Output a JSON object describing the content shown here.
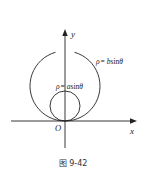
{
  "figure": {
    "caption": "图 9-42",
    "axes": {
      "x_label": "x",
      "y_label": "y",
      "origin_label": "O"
    },
    "curves": [
      {
        "name": "large-circle",
        "equation": "ρ = bsinθ",
        "label_rho": "ρ",
        "label_eq": "= ",
        "label_coef": "b",
        "label_fn": "sin",
        "label_var": "θ"
      },
      {
        "name": "small-circle",
        "equation": "ρ = asinθ",
        "label_rho": "ρ",
        "label_eq": "= ",
        "label_coef": "a",
        "label_fn": "sin",
        "label_var": "θ"
      }
    ],
    "colors": {
      "stroke": "#222222",
      "background": "#ffffff"
    }
  }
}
